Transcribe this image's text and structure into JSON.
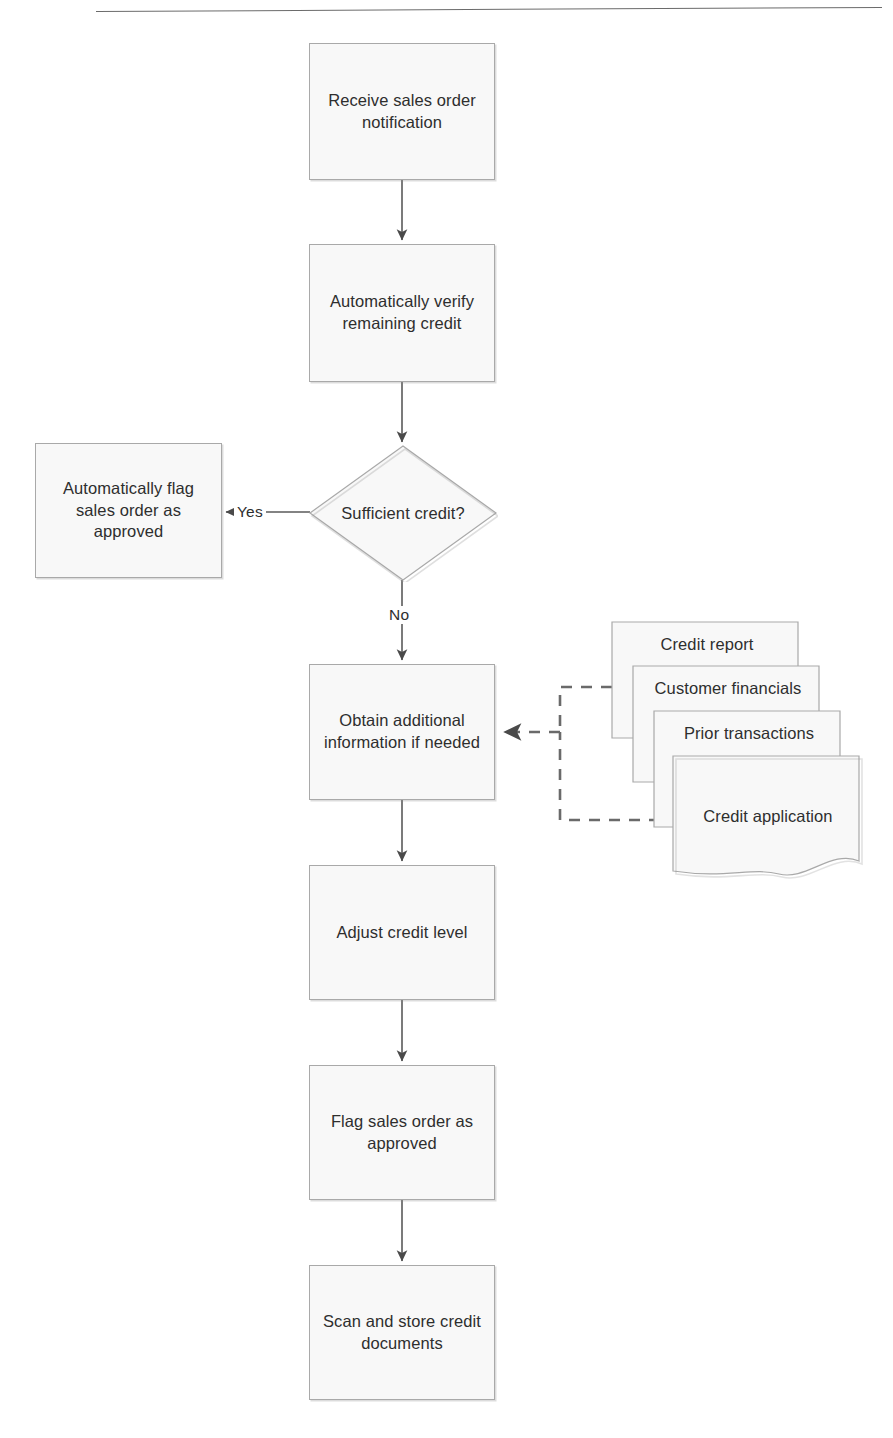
{
  "page": {
    "header_fragment": "",
    "background_color": "#ffffff",
    "node_fill": "#f8f8f8",
    "node_border": "#a9a9a9",
    "connector_color": "#555555",
    "text_color": "#2e2e2e"
  },
  "diagram": {
    "nodes": [
      {
        "id": "receive",
        "type": "process",
        "label": "Receive sales order notification"
      },
      {
        "id": "verify",
        "type": "process",
        "label": "Automatically verify remaining credit"
      },
      {
        "id": "decision",
        "type": "decision",
        "label": "Sufficient credit?"
      },
      {
        "id": "autoflag",
        "type": "process",
        "label": "Automatically flag sales order as approved"
      },
      {
        "id": "obtain",
        "type": "process",
        "label": "Obtain additional information if needed"
      },
      {
        "id": "adjust",
        "type": "process",
        "label": "Adjust credit level"
      },
      {
        "id": "flag",
        "type": "process",
        "label": "Flag sales order as approved"
      },
      {
        "id": "scan",
        "type": "process",
        "label": "Scan and store credit documents"
      }
    ],
    "documents": [
      {
        "id": "doc-credit-report",
        "label": "Credit report"
      },
      {
        "id": "doc-customer-financials",
        "label": "Customer financials"
      },
      {
        "id": "doc-prior-transactions",
        "label": "Prior transactions"
      },
      {
        "id": "doc-credit-application",
        "label": "Credit application"
      }
    ],
    "edge_labels": {
      "yes": "Yes",
      "no": "No"
    }
  }
}
